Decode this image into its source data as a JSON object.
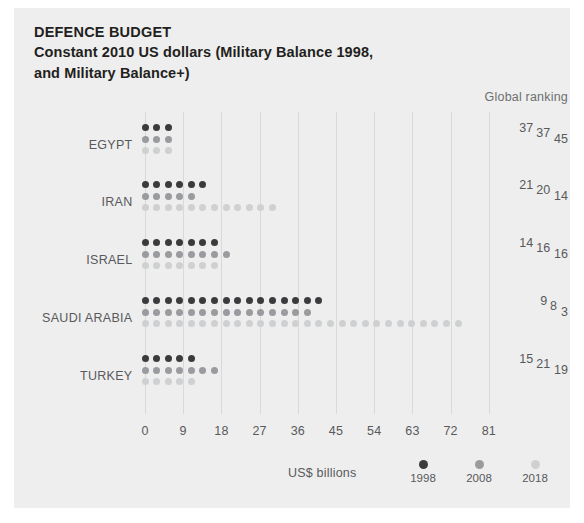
{
  "chart_title": "DEFENCE BUDGET",
  "chart_subtitle": "Constant 2010 US dollars (Military Balance 1998,\nand Military Balance+)",
  "ranking_header": "Global ranking",
  "axis_title": "US$  billions",
  "colors": {
    "panel_background": "#eeeeee",
    "page_background": "#ffffff",
    "series_1998": "#3b3b3d",
    "series_2008": "#9a9b9e",
    "series_2018": "#cfd0d2",
    "text": "#58595b",
    "title_text": "#231f20",
    "gridline": "#d9d9d9"
  },
  "legend": {
    "items": [
      {
        "label": "1998",
        "color_key": "series_1998"
      },
      {
        "label": "2008",
        "color_key": "series_2008"
      },
      {
        "label": "2018",
        "color_key": "series_2018"
      }
    ]
  },
  "chart_data": {
    "type": "bar",
    "title": "DEFENCE BUDGET",
    "subtitle": "Constant 2010 US dollars (Military Balance 1998, and Military Balance+)",
    "xlabel": "US$ billions",
    "ylabel": "",
    "xlim": [
      0,
      84
    ],
    "xticks": [
      0,
      9,
      18,
      27,
      36,
      45,
      54,
      63,
      72,
      81
    ],
    "xtick_labels": [
      "0",
      "9",
      "18",
      "27",
      "36",
      "45",
      "54",
      "63",
      "72",
      "81"
    ],
    "grid": true,
    "legend_position": "bottom-right",
    "units": "US$ billions (constant 2010)",
    "dot_unit_value": 2.75,
    "categories": [
      "EGYPT",
      "IRAN",
      "ISRAEL",
      "SAUDI ARABIA",
      "TURKEY"
    ],
    "series": [
      {
        "name": "1998",
        "color": "#3b3b3d",
        "values": [
          8.3,
          16.5,
          19.3,
          44.0,
          13.8
        ],
        "dots": [
          3,
          6,
          7,
          16,
          5
        ]
      },
      {
        "name": "2008",
        "color": "#9a9b9e",
        "values": [
          8.3,
          13.8,
          22.0,
          41.3,
          19.3
        ],
        "dots": [
          3,
          5,
          8,
          15,
          7
        ]
      },
      {
        "name": "2018",
        "color": "#cfd0d2",
        "values": [
          8.3,
          33.0,
          19.3,
          77.0,
          13.8
        ],
        "dots": [
          3,
          12,
          7,
          28,
          5
        ]
      }
    ],
    "rankings": {
      "header": "Global ranking",
      "EGYPT": {
        "1998": "37",
        "2008": "37",
        "2018": "45"
      },
      "IRAN": {
        "1998": "21",
        "2008": "20",
        "2018": "14"
      },
      "ISRAEL": {
        "1998": "14",
        "2008": "16",
        "2018": "16"
      },
      "SAUDI ARABIA": {
        "1998": "9",
        "2008": "8",
        "2018": "3"
      },
      "TURKEY": {
        "1998": "15",
        "2008": "21",
        "2018": "19"
      }
    }
  }
}
